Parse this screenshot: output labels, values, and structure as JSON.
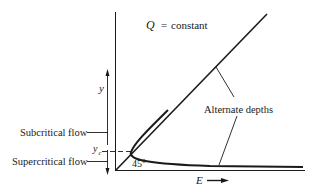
{
  "diagram": {
    "title_equation": {
      "var": "Q",
      "eq": "=",
      "value": "constant"
    },
    "y_axis_label": "y",
    "x_axis_label": "E",
    "critical_depth_label": "y",
    "critical_depth_subscript": "c",
    "angle_label": "45°",
    "annotations": {
      "subcritical": "Subcritical flow",
      "supercritical": "Supercritical flow",
      "alternate_depths": "Alternate depths"
    },
    "colors": {
      "ink": "#1a1a1a",
      "background": "#ffffff"
    }
  }
}
